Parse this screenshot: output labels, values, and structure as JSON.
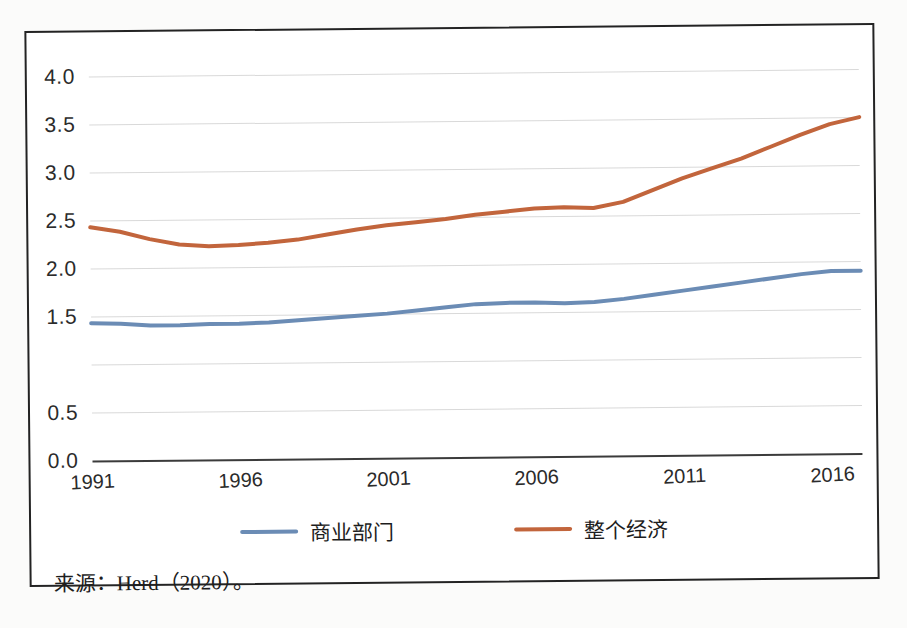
{
  "figure": {
    "source_note": "来源：Herd（2020）。"
  },
  "chart_data": {
    "type": "line",
    "title": "",
    "subtitle": "",
    "xlabel": "",
    "ylabel": "",
    "xlim": [
      1991,
      2017
    ],
    "ylim": [
      0.0,
      4.25
    ],
    "grid": true,
    "legend_position": "bottom",
    "y_tick_labels": [
      "4.0",
      "3.5",
      "3.0",
      "2.5",
      "2.0",
      "1.5",
      "0.5",
      "0.0"
    ],
    "y_tick_values": [
      4.0,
      3.5,
      3.0,
      2.5,
      2.0,
      1.5,
      1.0,
      0.5,
      0.0
    ],
    "x_tick_labels": [
      "1991",
      "1996",
      "2001",
      "2006",
      "2011",
      "2016"
    ],
    "x_tick_values": [
      1991,
      1996,
      2001,
      2006,
      2011,
      2016
    ],
    "x": [
      1991,
      1992,
      1993,
      1994,
      1995,
      1996,
      1997,
      1998,
      1999,
      2000,
      2001,
      2002,
      2003,
      2004,
      2005,
      2006,
      2007,
      2008,
      2009,
      2010,
      2011,
      2012,
      2013,
      2014,
      2015,
      2016,
      2017
    ],
    "series": [
      {
        "name": "商业部门",
        "color": "#6B8CB5",
        "values": [
          1.43,
          1.42,
          1.4,
          1.4,
          1.41,
          1.41,
          1.42,
          1.44,
          1.46,
          1.48,
          1.5,
          1.53,
          1.56,
          1.59,
          1.6,
          1.6,
          1.59,
          1.6,
          1.63,
          1.67,
          1.71,
          1.75,
          1.79,
          1.83,
          1.87,
          1.9,
          1.9
        ]
      },
      {
        "name": "整个经济",
        "color": "#C2653C",
        "values": [
          2.43,
          2.38,
          2.3,
          2.24,
          2.22,
          2.23,
          2.25,
          2.28,
          2.33,
          2.38,
          2.42,
          2.45,
          2.48,
          2.52,
          2.55,
          2.58,
          2.59,
          2.58,
          2.64,
          2.76,
          2.88,
          2.98,
          3.08,
          3.2,
          3.32,
          3.43,
          3.5
        ]
      }
    ]
  },
  "legend": {
    "items": [
      {
        "label": "商业部门",
        "color": "#6B8CB5"
      },
      {
        "label": "整个经济",
        "color": "#C2653C"
      }
    ]
  }
}
